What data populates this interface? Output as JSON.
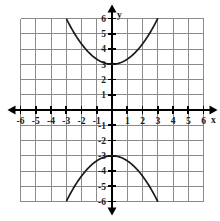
{
  "figure": {
    "kind": "cartesian-coordinate-plane",
    "background_color": "#ffffff",
    "grid_color": "#8a8a8a",
    "axis_color": "#000000",
    "curve_color": "#1a1a1a"
  },
  "axes": {
    "x_label": "x",
    "y_label": "y",
    "x_min": -6,
    "x_max": 6,
    "y_min": -6,
    "y_max": 6,
    "x_tick_labels": [
      "-6",
      "-5",
      "-4",
      "-3",
      "-2",
      "-1",
      "1",
      "2",
      "3",
      "4",
      "5",
      "6"
    ],
    "x_tick_values": [
      -6,
      -5,
      -4,
      -3,
      -2,
      -1,
      1,
      2,
      3,
      4,
      5,
      6
    ],
    "y_tick_labels": [
      "6",
      "5",
      "4",
      "3",
      "2",
      "1",
      "-1",
      "-2",
      "-3",
      "-4",
      "-5",
      "-6"
    ],
    "y_tick_values": [
      6,
      5,
      4,
      3,
      2,
      1,
      -1,
      -2,
      -3,
      -4,
      -5,
      -6
    ],
    "grid_step": 1,
    "arrows": [
      "left",
      "right",
      "up",
      "down"
    ]
  },
  "chart_data": {
    "type": "line",
    "title": "",
    "xlabel": "x",
    "ylabel": "y",
    "xlim": [
      -6,
      6
    ],
    "ylim": [
      -6,
      6
    ],
    "grid": true,
    "legend": "none",
    "series": [
      {
        "name": "upper parabola",
        "equation": "y = x^2/3 + 3",
        "vertex": [
          0,
          3
        ],
        "opens": "up",
        "x": [
          -3.2,
          -3.0,
          -2.5,
          -2.0,
          -1.5,
          -1.0,
          -0.5,
          0,
          0.5,
          1.0,
          1.5,
          2.0,
          2.5,
          3.0,
          3.2
        ],
        "values": [
          6.4,
          6.0,
          5.08,
          4.33,
          3.75,
          3.33,
          3.08,
          3.0,
          3.08,
          3.33,
          3.75,
          4.33,
          5.08,
          6.0,
          6.4
        ]
      },
      {
        "name": "lower parabola",
        "equation": "y = -x^2/3 - 3",
        "vertex": [
          0,
          -3
        ],
        "opens": "down",
        "x": [
          -3.2,
          -3.0,
          -2.5,
          -2.0,
          -1.5,
          -1.0,
          -0.5,
          0,
          0.5,
          1.0,
          1.5,
          2.0,
          2.5,
          3.0,
          3.2
        ],
        "values": [
          -6.4,
          -6.0,
          -5.08,
          -4.33,
          -3.75,
          -3.33,
          -3.08,
          -3.0,
          -3.08,
          -3.33,
          -3.75,
          -4.33,
          -5.08,
          -6.0,
          -6.4
        ]
      }
    ]
  }
}
